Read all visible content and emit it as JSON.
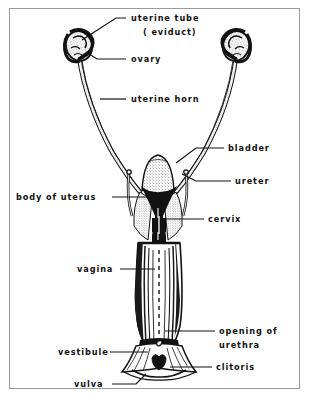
{
  "figure": {
    "border_color": "#9a9a9a",
    "ink_color": "#121212",
    "background_color": "#ffffff"
  },
  "labels": [
    {
      "id": "uterine-tube",
      "line1": "uterine tube",
      "line2": "( eviduct)",
      "text_x": 131,
      "text_y": 21,
      "text_y2": 35,
      "leader": "M126,18 L116,18 L82,40"
    },
    {
      "id": "ovary",
      "line1": "ovary",
      "line2": "",
      "text_x": 131,
      "text_y": 62,
      "text_y2": 0,
      "leader": "M126,59 L97,59 L86,52"
    },
    {
      "id": "uterine-horn",
      "line1": "uterine horn",
      "line2": "",
      "text_x": 131,
      "text_y": 102,
      "text_y2": 0,
      "leader": "M126,99 L100,99"
    },
    {
      "id": "bladder",
      "line1": "bladder",
      "line2": "",
      "text_x": 228,
      "text_y": 151,
      "text_y2": 0,
      "leader": "M224,148 L196,148 L176,163"
    },
    {
      "id": "ureter",
      "line1": "ureter",
      "line2": "",
      "text_x": 235,
      "text_y": 184,
      "text_y2": 0,
      "leader": "M231,181 L196,181 L182,174"
    },
    {
      "id": "body-of-uterus",
      "line1": "body of uterus",
      "line2": "",
      "text_x": 16,
      "text_y": 200,
      "text_y2": 0,
      "leader": "M112,197 L152,197"
    },
    {
      "id": "cervix",
      "line1": "cervix",
      "line2": "",
      "text_x": 208,
      "text_y": 222,
      "text_y2": 0,
      "leader": "M204,219 L160,219"
    },
    {
      "id": "vagina",
      "line1": "vagina",
      "line2": "",
      "text_x": 77,
      "text_y": 272,
      "text_y2": 0,
      "leader": "M120,269 L155,269"
    },
    {
      "id": "opening-of-urethra",
      "line1": "opening of",
      "line2": "urethra",
      "text_x": 219,
      "text_y": 334,
      "text_y2": 348,
      "leader": "M215,331 L165,331"
    },
    {
      "id": "vestibule",
      "line1": "vestibule",
      "line2": "",
      "text_x": 58,
      "text_y": 355,
      "text_y2": 0,
      "leader": "M110,352 L148,352"
    },
    {
      "id": "clitoris",
      "line1": "clitoris",
      "line2": "",
      "text_x": 216,
      "text_y": 370,
      "text_y2": 0,
      "leader": "M212,367 L170,367"
    },
    {
      "id": "vulva",
      "line1": "vulva",
      "line2": "",
      "text_x": 74,
      "text_y": 387,
      "text_y2": 0,
      "leader": "M112,384 L136,384 L146,374"
    }
  ],
  "anatomy": {
    "left_ovary": "stippled oval with coiled uterine tube",
    "right_ovary": "stippled oval with coiled uterine tube",
    "left_horn": "long curved tube descending to body of uterus",
    "right_horn": "long curved tube descending to body of uterus",
    "bladder": "stippled dome between the horns",
    "ureters": "paired slender tubes flanking the uterine body",
    "uterine_body": "dark solid column narrowing at the cervix",
    "vagina": "striated cone with dashed midline",
    "vestibule": "flared skirt below the vagina",
    "clitoris": "small dark lobed structure at the ventral commissure",
    "vulva": "external opening at the base"
  }
}
